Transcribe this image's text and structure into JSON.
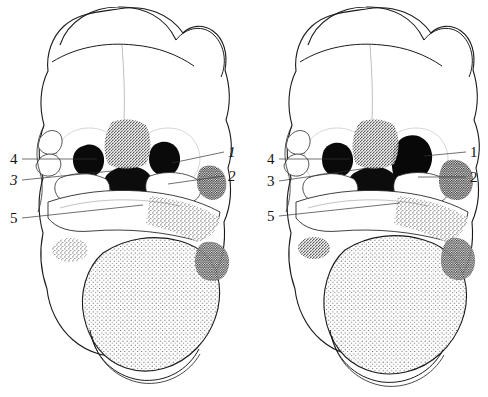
{
  "figure": {
    "style": "stipple pen-and-ink scientific drawing",
    "background_color": "#ffffff",
    "ink_color": "#111111",
    "leader_line_color": "#333333",
    "panel_count": 2
  },
  "panels": [
    {
      "id": "left-panel",
      "name": "left-embryo-head",
      "callouts": [
        {
          "key": "1",
          "label": "1",
          "style": "italic",
          "side": "right",
          "text_x": 228,
          "text_y": 157,
          "line": [
            224,
            152,
            172,
            163
          ]
        },
        {
          "key": "2",
          "label": "2",
          "style": "italic",
          "side": "right",
          "text_x": 228,
          "text_y": 181,
          "line": [
            224,
            176,
            168,
            184
          ]
        },
        {
          "key": "3",
          "label": "3",
          "style": "italic",
          "side": "left",
          "text_x": 10,
          "text_y": 185,
          "line": [
            22,
            180,
            112,
            171
          ]
        },
        {
          "key": "4",
          "label": "4",
          "style": "normal",
          "side": "left",
          "text_x": 10,
          "text_y": 164,
          "line": [
            22,
            159,
            97,
            159
          ]
        },
        {
          "key": "5",
          "label": "5",
          "style": "normal",
          "side": "left",
          "text_x": 10,
          "text_y": 223,
          "line": [
            22,
            218,
            143,
            205
          ]
        }
      ]
    },
    {
      "id": "right-panel",
      "name": "right-embryo-head",
      "callouts": [
        {
          "key": "1",
          "label": "1",
          "style": "normal",
          "side": "right",
          "text_x": 470,
          "text_y": 157,
          "line": [
            466,
            152,
            424,
            156
          ]
        },
        {
          "key": "2",
          "label": "2",
          "style": "normal",
          "side": "right",
          "text_x": 470,
          "text_y": 182,
          "line": [
            466,
            177,
            418,
            177
          ]
        },
        {
          "key": "3",
          "label": "3",
          "style": "normal",
          "side": "left",
          "text_x": 267,
          "text_y": 186,
          "line": [
            279,
            181,
            368,
            168
          ]
        },
        {
          "key": "4",
          "label": "4",
          "style": "normal",
          "side": "left",
          "text_x": 267,
          "text_y": 164,
          "line": [
            279,
            159,
            350,
            159
          ]
        },
        {
          "key": "5",
          "label": "5",
          "style": "normal",
          "side": "left",
          "text_x": 267,
          "text_y": 221,
          "line": [
            279,
            216,
            400,
            203
          ]
        }
      ]
    }
  ],
  "legend_keys": [
    "1",
    "2",
    "3",
    "4",
    "5"
  ]
}
